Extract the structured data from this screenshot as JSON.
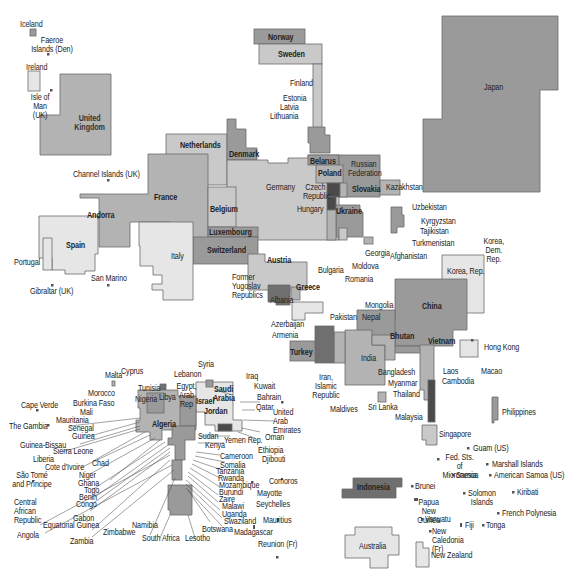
{
  "colors": {
    "c1": "#e6e6e6",
    "c2": "#c9c9c9",
    "c3": "#b3b3b3",
    "c4": "#9a9a9a",
    "c5": "#6f6f6f",
    "c6": "#4a4a4a",
    "border": "#666666"
  },
  "labels": {
    "iceland": "Iceland",
    "faeroe": "Faeroe Islands (Den)",
    "ireland": "Ireland",
    "isle_of_man": "Isle of Man (UK)",
    "uk": "United Kingdom",
    "channel_islands": "Channel Islands (UK)",
    "norway": "Norway",
    "sweden": "Sweden",
    "finland": "Finland",
    "estonia": "Estonia",
    "latvia": "Latvia",
    "lithuania": "Lithuania",
    "netherlands": "Netherlands",
    "denmark": "Denmark",
    "belarus": "Belarus",
    "russia": "Russian Federation",
    "poland": "Poland",
    "germany": "Germany",
    "czech": "Czech Republic",
    "slovakia": "Slovakia",
    "kazakhstan": "Kazakhstan",
    "hungary": "Hungary",
    "ukraine": "Ukraine",
    "france": "France",
    "belgium": "Belgium",
    "luxembourg": "Luxembourg",
    "switzerland": "Switzerland",
    "andorra": "Andorra",
    "spain": "Spain",
    "portugal": "Portugal",
    "gibraltar": "Gibraltar (UK)",
    "san_marino": "San Marino",
    "italy": "Italy",
    "austria": "Austria",
    "former_yugoslav": "Former Yugoslav Republics",
    "albania": "Albania",
    "greece": "Greece",
    "bulgaria": "Bulgaria",
    "romania": "Romania",
    "moldova": "Moldova",
    "georgia": "Georgia",
    "afghanistan": "Afghanistan",
    "uzbekistan": "Uzbekistan",
    "kyrgyzstan": "Kyrgyzstan",
    "tajikistan": "Tajikistan",
    "turkmenistan": "Turkmenistan",
    "japan": "Japan",
    "korea_dem": "Korea, Dem. Rep.",
    "korea_rep": "Korea, Rep.",
    "mongolia": "Mongolia",
    "china": "China",
    "azerbaijan": "Azerbaijan",
    "armenia": "Armenia",
    "pakistan": "Pakistan",
    "nepal": "Nepal",
    "bhutan": "Bhutan",
    "vietnam": "Vietnam",
    "turkey": "Turkey",
    "india": "India",
    "iran": "Iran, Islamic Republic",
    "bangladesh": "Bangladesh",
    "myanmar": "Myanmar",
    "thailand": "Thailand",
    "laos": "Laos",
    "cambodia": "Cambodia",
    "hong_kong": "Hong Kong",
    "macao": "Macao",
    "maldives": "Maldives",
    "sri_lanka": "Sri Lanka",
    "malaysia": "Malaysia",
    "singapore": "Singapore",
    "philippines": "Philippines",
    "guam": "Guam (US)",
    "micronesia": "Fed. Sts. of Micronesia",
    "marshall": "Marshall Islands",
    "samoa": "Samoa",
    "american_samoa": "American Samoa (US)",
    "indonesia": "Indonesia",
    "brunei": "Brunei",
    "solomon": "Solomon Islands",
    "kiribati": "Kiribati",
    "png": "Papua New Guinea",
    "french_polynesia": "French Polynesia",
    "vanuatu": "Vanuatu",
    "fiji": "Fiji",
    "tonga": "Tonga",
    "new_caledonia": "New Caledonia (Fr)",
    "australia": "Australia",
    "new_zealand": "New Zealand",
    "cyprus": "Cyprus",
    "malta": "Malta",
    "syria": "Syria",
    "lebanon": "Lebanon",
    "iraq": "Iraq",
    "kuwait": "Kuwait",
    "tunisia": "Tunisia",
    "egypt": "Egypt, Arab Rep",
    "israel": "Israel",
    "saudi": "Saudi Arabia",
    "bahrain": "Bahrain",
    "morocco": "Morocco",
    "nigeria": "Nigeria",
    "libya": "Libya",
    "jordan": "Jordan",
    "qatar": "Qatar",
    "uae": "United Arab Emirates",
    "burkina": "Burkina Faso",
    "mali": "Mali",
    "cape_verde": "Cape Verde",
    "mauritania": "Mauritania",
    "gambia": "The Gambia",
    "senegal": "Senegal",
    "guinea": "Guinea",
    "algeria": "Algeria",
    "sudan": "Sudan",
    "yemen": "Yemen Rep.",
    "oman": "Oman",
    "guinea_bissau": "Guinea-Bissau",
    "sierra_leone": "Sierra Leone",
    "liberia": "Liberia",
    "chad": "Chad",
    "cote_divoire": "Cote d'Ivoire",
    "kenya": "Kenya",
    "ethiopia": "Ethiopia",
    "cameroon": "Cameroon",
    "djibouti": "Djibouti",
    "somalia": "Somalia",
    "sao_tome": "São Tomé and Príncipe",
    "niger": "Niger",
    "ghana": "Ghana",
    "togo": "Togo",
    "benin": "Benin",
    "congo": "Congo",
    "tanzania": "Tanzania",
    "rwanda": "Rwanda",
    "mozambique": "Mozambique",
    "burundi": "Burundi",
    "zaire": "Zaire",
    "malawi": "Malawi",
    "uganda": "Uganda",
    "comoros": "Comoros",
    "mayotte": "Mayotte",
    "seychelles": "Seychelles",
    "car": "Central African Republic",
    "gabon": "Gabon",
    "eq_guinea": "Equatorial Guinea",
    "angola": "Angola",
    "zambia": "Zambia",
    "zimbabwe": "Zimbabwe",
    "namibia": "Namibia",
    "south_africa": "South Africa",
    "lesotho": "Lesotho",
    "botswana": "Botswana",
    "swaziland": "Swaziland",
    "mauritius": "Mauritius",
    "madagascar": "Madagascar",
    "reunion": "Reunion (Fr)"
  }
}
